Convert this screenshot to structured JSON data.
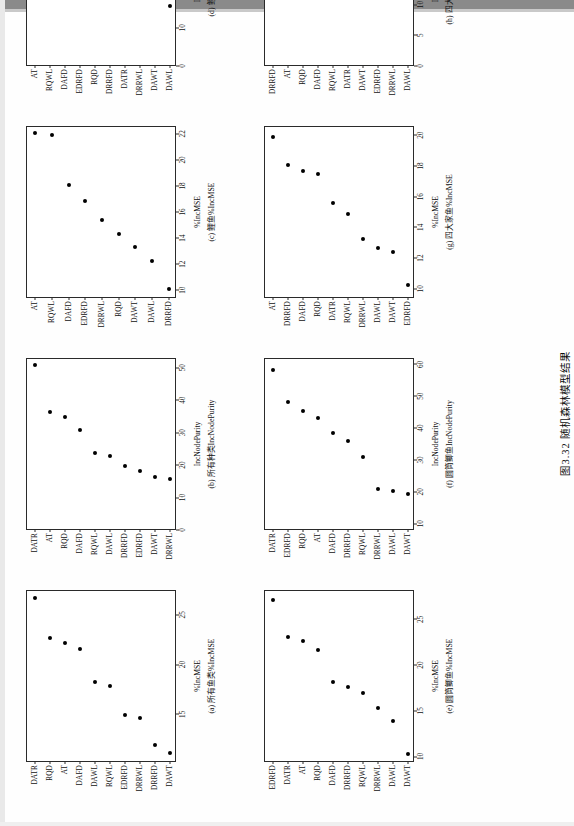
{
  "figure": {
    "caption": "图3.32  随机森林模型结果",
    "caption_number": "图3.32",
    "caption_title": "随机森林模型结果"
  },
  "chart_data": [
    {
      "id": "a",
      "type": "scatter",
      "panel_label": "(a) 所有鱼类%IncMSE",
      "xlabel": "%IncMSE",
      "ylabel": "",
      "categories": [
        "DATR",
        "RQD",
        "AT",
        "DAFD",
        "DAWL",
        "RQWL",
        "EDRFD",
        "DRRWL",
        "DRRFD",
        "DAWT"
      ],
      "values": [
        26.6,
        22.6,
        22.1,
        21.5,
        18.1,
        17.7,
        14.8,
        14.5,
        11.8,
        11.0
      ],
      "xticks": [
        15,
        20,
        25
      ],
      "xlim": [
        10.2,
        27.5
      ],
      "grid": false
    },
    {
      "id": "b",
      "type": "scatter",
      "panel_label": "(b) 所有种类IncNodePurity",
      "xlabel": "IncNodePurity",
      "ylabel": "",
      "categories": [
        "DATR",
        "AT",
        "RQD",
        "DAFD",
        "RQWL",
        "DAWL",
        "DRRFD",
        "EDRFD",
        "DAWT",
        "DRRWL"
      ],
      "values": [
        50.5,
        36.0,
        34.5,
        30.5,
        23.5,
        22.5,
        19.5,
        18.0,
        16.0,
        15.5
      ],
      "xticks": [
        0,
        10,
        20,
        30,
        40,
        50
      ],
      "xlim": [
        0,
        53
      ],
      "grid": false
    },
    {
      "id": "c",
      "type": "scatter",
      "panel_label": "(c) 鲤鱼%IncMSE",
      "xlabel": "%IncMSE",
      "ylabel": "",
      "categories": [
        "AT",
        "RQWL",
        "DAFD",
        "EDRFD",
        "DRRWL",
        "RQD",
        "DAWT",
        "DAWL",
        "DRRFD"
      ],
      "values": [
        22.0,
        21.8,
        18.0,
        16.8,
        15.3,
        14.2,
        13.2,
        12.2,
        10.0
      ],
      "xticks": [
        10,
        12,
        14,
        16,
        18,
        20,
        22
      ],
      "xlim": [
        9.4,
        22.6
      ],
      "grid": false
    },
    {
      "id": "d",
      "type": "scatter",
      "panel_label": "(d) 鲤鱼IncNodePurity",
      "xlabel": "IncNodePurity",
      "ylabel": "",
      "categories": [
        "AT",
        "RQWL",
        "DAFD",
        "EDRFD",
        "RQD",
        "DRRFD",
        "DATR",
        "DRRWL",
        "DAWT",
        "DAWL"
      ],
      "values": [
        42.5,
        40.5,
        28.5,
        28.0,
        26.0,
        22.5,
        22.3,
        21.0,
        21.0,
        15.5
      ],
      "xticks": [
        0,
        10,
        20,
        30,
        40
      ],
      "xlim": [
        0,
        45
      ],
      "grid": false
    },
    {
      "id": "e",
      "type": "scatter",
      "panel_label": "(e) 圆筒鲫鱼%IncMSE",
      "xlabel": "%IncMSE",
      "ylabel": "",
      "categories": [
        "EDRFD",
        "DATR",
        "AT",
        "RQD",
        "DAFD",
        "DRRFD",
        "RQWL",
        "DRRWL",
        "DAWL",
        "DAWT"
      ],
      "values": [
        27.0,
        23.0,
        22.5,
        21.5,
        18.0,
        17.5,
        16.8,
        15.2,
        13.8,
        10.2
      ],
      "xticks": [
        10,
        15,
        20,
        25
      ],
      "xlim": [
        9.4,
        28.2
      ],
      "grid": false
    },
    {
      "id": "f",
      "type": "scatter",
      "panel_label": "(f) 圆筒鲫鱼IncNodePurity",
      "xlabel": "IncNodePurity",
      "ylabel": "",
      "categories": [
        "DATR",
        "EDRFD",
        "RQD",
        "AT",
        "DAFD",
        "DRRFD",
        "RQWL",
        "DRRWL",
        "DAWL",
        "DAWT"
      ],
      "values": [
        58.0,
        48.0,
        45.0,
        43.0,
        38.0,
        35.5,
        30.5,
        20.5,
        20.0,
        19.0
      ],
      "xticks": [
        10,
        20,
        30,
        40,
        50,
        60
      ],
      "xlim": [
        8,
        62
      ],
      "grid": false
    },
    {
      "id": "g",
      "type": "scatter",
      "panel_label": "(g) 四大家鱼%IncMSE",
      "xlabel": "%IncMSE",
      "ylabel": "",
      "categories": [
        "AT",
        "DRRFD",
        "DAFD",
        "RQD",
        "DATR",
        "RQWL",
        "DRRWL",
        "DAWL",
        "DAWT",
        "EDRFD"
      ],
      "values": [
        19.8,
        18.0,
        17.6,
        17.4,
        15.5,
        14.8,
        13.2,
        12.6,
        12.3,
        10.2
      ],
      "xticks": [
        10,
        12,
        14,
        16,
        18,
        20
      ],
      "xlim": [
        9.4,
        20.6
      ],
      "grid": false
    },
    {
      "id": "h",
      "type": "scatter",
      "panel_label": "(h) 四大家鱼IncNodePurity",
      "xlabel": "IncNodePurity",
      "ylabel": "",
      "categories": [
        "DRRFD",
        "AT",
        "RQD",
        "DAFD",
        "RQWL",
        "DATR",
        "DAWT",
        "EDRFD",
        "DRRWL",
        "DAWL"
      ],
      "values": [
        26.5,
        25.3,
        21.5,
        20.8,
        19.8,
        16.5,
        15.0,
        13.0,
        13.0,
        13.0
      ],
      "xticks": [
        0,
        5,
        10,
        15,
        20,
        25
      ],
      "xlim": [
        0,
        28
      ],
      "grid": false
    }
  ]
}
